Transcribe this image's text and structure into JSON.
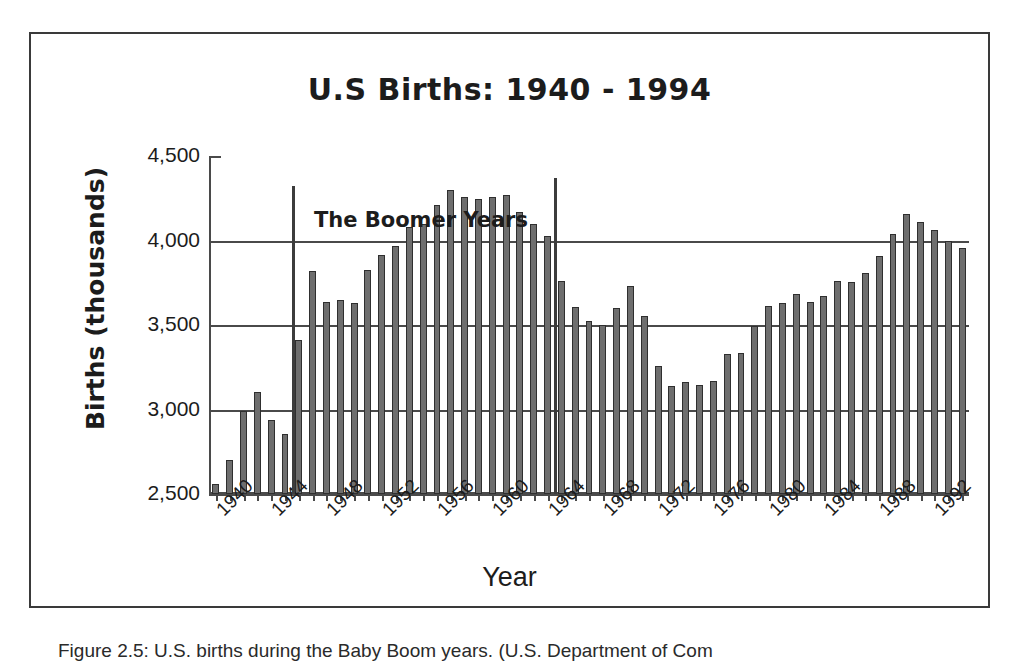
{
  "figure": {
    "caption": "Figure 2.5: U.S. births during the Baby Boom years. (U.S. Department of Com"
  },
  "chart_data": {
    "type": "bar",
    "title": "U.S Births: 1940 - 1994",
    "xlabel": "Year",
    "ylabel": "Births (thousands)",
    "ylim": [
      2500,
      4500
    ],
    "yticks": [
      2500,
      3000,
      3500,
      4000,
      4500
    ],
    "ytick_labels": [
      "2,500",
      "3,000",
      "3,500",
      "4,000",
      "4,500"
    ],
    "grid": true,
    "legend": false,
    "xtick_labels": [
      "1940",
      "1944",
      "1948",
      "1952",
      "1956",
      "1960",
      "1964",
      "1968",
      "1972",
      "1976",
      "1980",
      "1984",
      "1988",
      "1992"
    ],
    "xtick_step": 4,
    "bar_color": "#6e6e6e",
    "bar_edge_color": "#2f2f2f",
    "categories": [
      1940,
      1941,
      1942,
      1943,
      1944,
      1945,
      1946,
      1947,
      1948,
      1949,
      1950,
      1951,
      1952,
      1953,
      1954,
      1955,
      1956,
      1957,
      1958,
      1959,
      1960,
      1961,
      1962,
      1963,
      1964,
      1965,
      1966,
      1967,
      1968,
      1969,
      1970,
      1971,
      1972,
      1973,
      1974,
      1975,
      1976,
      1977,
      1978,
      1979,
      1980,
      1981,
      1982,
      1983,
      1984,
      1985,
      1986,
      1987,
      1988,
      1989,
      1990,
      1991,
      1992,
      1993,
      1994
    ],
    "values": [
      2559,
      2703,
      2989,
      3104,
      2939,
      2858,
      3411,
      3817,
      3637,
      3649,
      3632,
      3823,
      3913,
      3965,
      4078,
      4097,
      4210,
      4300,
      4255,
      4245,
      4258,
      4268,
      4167,
      4098,
      4027,
      3760,
      3606,
      3521,
      3502,
      3600,
      3731,
      3556,
      3258,
      3137,
      3160,
      3144,
      3168,
      3327,
      3333,
      3494,
      3612,
      3629,
      3681,
      3639,
      3669,
      3761,
      3757,
      3809,
      3910,
      4041,
      4158,
      4111,
      4065,
      4000,
      3953
    ],
    "annotation": {
      "label": "The Boomer Years",
      "start_year": 1946,
      "end_year": 1964
    }
  }
}
